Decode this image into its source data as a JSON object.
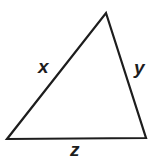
{
  "figure": {
    "kind": "geometry-diagram",
    "shape": "triangle",
    "background_color": "#ffffff",
    "stroke_color": "#1d1d1d",
    "stroke_width": 2,
    "label_color": "#1d1d1d"
  },
  "chart_data": {
    "type": "diagram",
    "title": "",
    "shape": "triangle",
    "vertices": [
      {
        "name": "apex",
        "x": 106,
        "y": 13
      },
      {
        "name": "bottom-right",
        "x": 146,
        "y": 138
      },
      {
        "name": "bottom-left",
        "x": 7,
        "y": 139
      }
    ],
    "sides": [
      {
        "label": "x",
        "from": "bottom-left",
        "to": "apex"
      },
      {
        "label": "y",
        "from": "apex",
        "to": "bottom-right"
      },
      {
        "label": "z",
        "from": "bottom-left",
        "to": "bottom-right"
      }
    ]
  },
  "labels": {
    "left_side": "x",
    "right_side": "y",
    "bottom_side": "z"
  }
}
